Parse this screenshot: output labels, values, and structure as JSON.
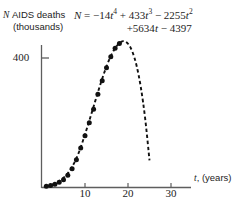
{
  "chart_data": {
    "type": "scatter",
    "title": "",
    "ylabel_line1": "AIDS deaths",
    "ylabel_line2": "(thousands)",
    "ylabel_symbol": "N",
    "xlabel_symbol": "t",
    "xlabel_rest": ", (years)",
    "equation": {
      "lhs": "N",
      "eq": " = ",
      "term1_coef": "−14",
      "term1_var": "t",
      "term1_exp": "4",
      "term2_sign": " + ",
      "term2_coef": "433",
      "term2_var": "t",
      "term2_exp": "3",
      "term3_sign": " − ",
      "term3_coef": "2255",
      "term3_var": "t",
      "term3_exp": "2",
      "term4": "+5634",
      "term4_var": "t",
      "term5": " − 4397",
      "full_text": "N = -14t^4 + 433t^3 - 2255t^2 + 5634t - 4397"
    },
    "xlim": [
      0,
      33
    ],
    "ylim": [
      0,
      520
    ],
    "xticks": [
      10,
      20,
      30
    ],
    "xtick_labels": [
      "10",
      "20",
      "30"
    ],
    "yticks": [
      400
    ],
    "ytick_labels": [
      "400"
    ],
    "grid": false,
    "legend": null,
    "series": [
      {
        "name": "Reported AIDS deaths",
        "style": "points",
        "marker": "filled-circle",
        "color": "#111111",
        "x": [
          1,
          2,
          3,
          4,
          5,
          6,
          7,
          8,
          9,
          10,
          11,
          12,
          13,
          14,
          15,
          16,
          17,
          18
        ],
        "y": [
          4,
          6,
          10,
          16,
          24,
          38,
          58,
          86,
          122,
          160,
          200,
          242,
          288,
          330,
          370,
          404,
          430,
          445
        ]
      },
      {
        "name": "Quartic model",
        "style": "dashed-line",
        "color": "#111111",
        "x": [
          1,
          2,
          3,
          4,
          5,
          6,
          7,
          8,
          9,
          10,
          11,
          12,
          13,
          14,
          15,
          16,
          17,
          18,
          19,
          20,
          21,
          22,
          23,
          24,
          25
        ],
        "y": [
          3,
          7,
          12,
          20,
          30,
          44,
          64,
          90,
          124,
          164,
          206,
          250,
          294,
          336,
          374,
          406,
          430,
          446,
          452,
          444,
          420,
          376,
          308,
          212,
          84
        ]
      }
    ]
  }
}
